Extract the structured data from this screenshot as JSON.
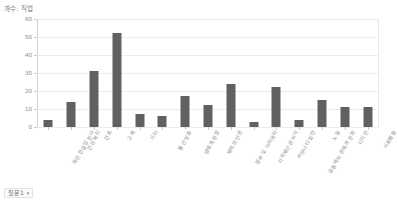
{
  "chart": {
    "title": "개수: 직업",
    "y_axis": {
      "ticks": [
        "0",
        "10",
        "20",
        "30",
        "40",
        "50",
        "60"
      ]
    }
  },
  "controls": {
    "question_select": {
      "label": "질문1",
      "chevron": "▾"
    }
  },
  "chart_data": {
    "type": "bar",
    "title": "개수: 직업",
    "xlabel": "",
    "ylabel": "",
    "ylim": [
      0,
      60
    ],
    "grid": true,
    "legend": "none",
    "bar_color": "#616161",
    "categories": [
      "개인 컨설팅 분야",
      "건강 복지",
      "건축",
      "교육",
      "기타",
      "통신 방송",
      "생태계 환경",
      "재택의 인권",
      "정부 및 아카데미",
      "지적재산권 저작",
      "커뮤니티 발전",
      "공동체와 권력과 문화",
      "노동",
      "디자인",
      "사회평등"
    ],
    "values": [
      4,
      14,
      31,
      52,
      7,
      6,
      17,
      12,
      24,
      3,
      22,
      4,
      15,
      11,
      11
    ]
  }
}
